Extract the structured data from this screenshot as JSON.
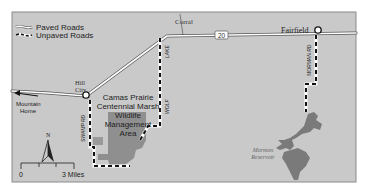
{
  "map": {
    "background_color": "#c9c9c9",
    "frame_color": "#8a8a8a",
    "wildlife_area_color": "#8f8f8f",
    "reservoir_color": "#7a7a7a"
  },
  "legend": {
    "paved_label": "Paved Roads",
    "unpaved_label": "Unpaved Roads"
  },
  "places": {
    "corral": "Corral",
    "fairfield": "Fairfield",
    "hill_city_line1": "Hill",
    "hill_city_line2": "City",
    "mountain_home_line1": "Mountain",
    "mountain_home_line2": "Home"
  },
  "area": {
    "line1": "Camas Prairie",
    "line2": "Centennial Marsh",
    "line3": "Wildlife",
    "line4": "Management",
    "line5": "Area"
  },
  "reservoir": {
    "line1": "Mormon",
    "line2": "Reservoir"
  },
  "roads": {
    "highway_number": "20",
    "swamp_rd": "SWAMP RD",
    "wolf": "WOLF",
    "lake": "LAKE",
    "mormon_rd": "MORMAN RD"
  },
  "compass": {
    "north_label": "N"
  },
  "scale": {
    "start_label": "0",
    "end_label": "3 Miles"
  }
}
